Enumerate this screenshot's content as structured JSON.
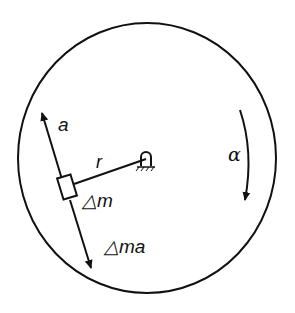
{
  "diagram": {
    "type": "rotating-disk-inertia-force",
    "labels": {
      "acceleration": "a",
      "radius": "r",
      "mass_element": "△m",
      "inertia_force": "△ma",
      "angular_acceleration": "α"
    },
    "colors": {
      "stroke": "#111111",
      "background": "#ffffff"
    }
  }
}
